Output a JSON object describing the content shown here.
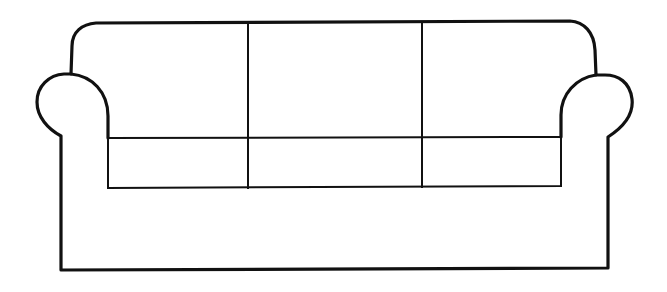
{
  "image": {
    "subject": "sofa line drawing",
    "width": 667,
    "height": 292,
    "stroke_color": "#111111",
    "background_color": "#ffffff"
  },
  "sofa": {
    "back_cushions": 3,
    "seat_cushions": 3,
    "arms": [
      "left",
      "right"
    ]
  }
}
